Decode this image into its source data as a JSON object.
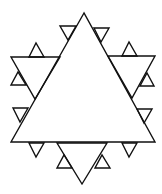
{
  "figure": {
    "stroke_color": "#111111",
    "background_color": "#ffffff",
    "iterations_shown": 2,
    "main_triangle_count": 1,
    "first_level_triangles": 3,
    "second_level_triangles": 12
  }
}
